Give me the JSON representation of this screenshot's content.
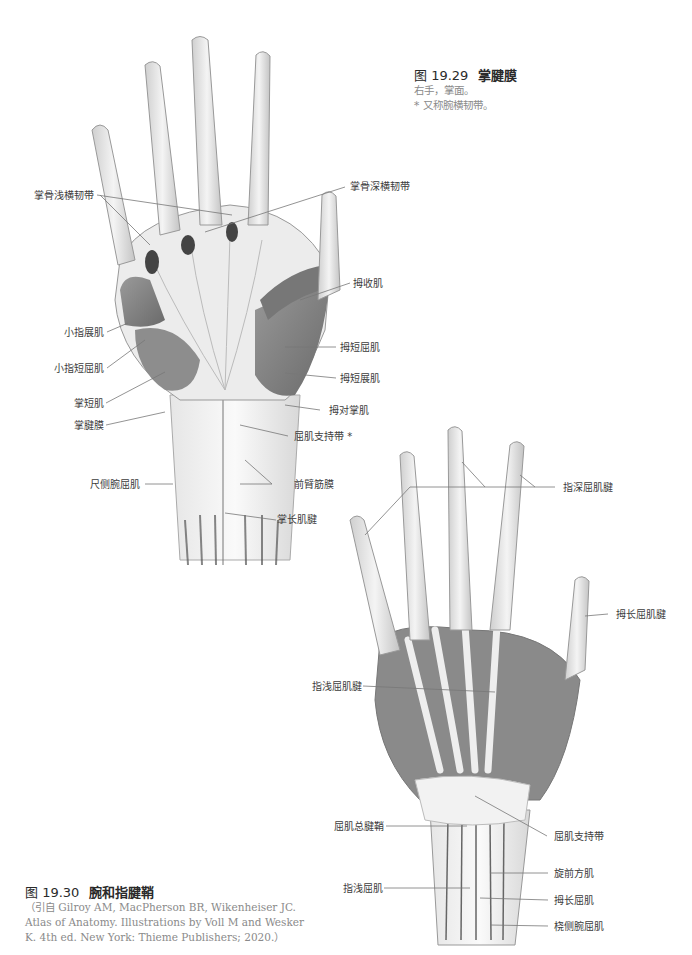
{
  "figure_29": {
    "number": "图 19.29",
    "title": "掌腱膜",
    "caption_lines": [
      "右手，掌面。",
      "* 又称腕横韧带。"
    ],
    "labels": {
      "superficial_transverse_metacarpal": "掌骨浅横韧带",
      "deep_transverse_metacarpal": "掌骨深横韧带",
      "adductor_pollicis": "拇收肌",
      "abductor_digiti_minimi": "小指展肌",
      "flexor_digiti_minimi_brevis": "小指短屈肌",
      "flexor_pollicis_brevis": "拇短屈肌",
      "abductor_pollicis_brevis": "拇短展肌",
      "palmaris_brevis": "掌短肌",
      "opponens_pollicis": "拇对掌肌",
      "palmar_aponeurosis": "掌腱膜",
      "flexor_retinaculum": "屈肌支持带 *",
      "flexor_carpi_ulnaris": "尺侧腕屈肌",
      "antebrachial_fascia": "前臂筋膜",
      "palmaris_longus_tendon": "掌长肌腱"
    }
  },
  "figure_30": {
    "number": "图 19.30",
    "title": "腕和指腱鞘",
    "citation": "（引自 Gilroy AM, MacPherson BR, Wikenheiser JC. Atlas of Anatomy. Illustrations by Voll M and Wesker K. 4th ed. New York: Thieme Publishers; 2020.）",
    "labels": {
      "fdp_tendons": "指深屈肌腱",
      "fpl_tendon": "拇长屈肌腱",
      "fds_tendons": "指浅屈肌腱",
      "common_flexor_sheath": "屈肌总腱鞘",
      "flexor_retinaculum": "屈肌支持带",
      "pronator_quadratus": "旋前方肌",
      "fds": "指浅屈肌",
      "flexor_pollicis_longus": "拇长屈肌",
      "flexor_carpi_radialis": "桡侧腕屈肌"
    }
  }
}
